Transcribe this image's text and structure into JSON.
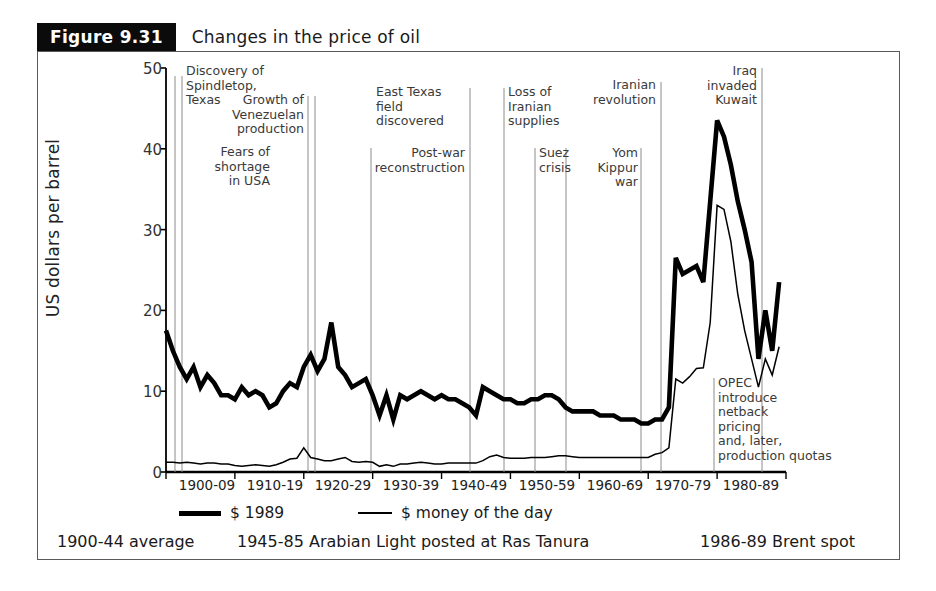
{
  "figure": {
    "badge": "Figure 9.31",
    "title": "Changes in the price of oil"
  },
  "chart_data": {
    "type": "line",
    "title": "Changes in the price of oil",
    "xlabel": "",
    "ylabel": "US dollars per barrel",
    "ylim": [
      0,
      50
    ],
    "yticks": [
      0,
      10,
      20,
      30,
      40,
      50
    ],
    "xtick_labels": [
      "1900-09",
      "1910-19",
      "1920-29",
      "1930-39",
      "1940-49",
      "1950-59",
      "1960-69",
      "1970-79",
      "1980-89"
    ],
    "xlim": [
      1900,
      1990
    ],
    "grid": false,
    "legend_position": "below-axis",
    "series": [
      {
        "name": "$ 1989",
        "style": "thick",
        "x": [
          1900,
          1901,
          1902,
          1903,
          1904,
          1905,
          1906,
          1907,
          1908,
          1909,
          1910,
          1911,
          1912,
          1913,
          1914,
          1915,
          1916,
          1917,
          1918,
          1919,
          1920,
          1921,
          1922,
          1923,
          1924,
          1925,
          1926,
          1927,
          1928,
          1929,
          1930,
          1931,
          1932,
          1933,
          1934,
          1935,
          1936,
          1937,
          1938,
          1939,
          1940,
          1941,
          1942,
          1943,
          1944,
          1945,
          1946,
          1947,
          1948,
          1949,
          1950,
          1951,
          1952,
          1953,
          1954,
          1955,
          1956,
          1957,
          1958,
          1959,
          1960,
          1961,
          1962,
          1963,
          1964,
          1965,
          1966,
          1967,
          1968,
          1969,
          1970,
          1971,
          1972,
          1973,
          1974,
          1975,
          1976,
          1977,
          1978,
          1979,
          1980,
          1981,
          1982,
          1983,
          1984,
          1985,
          1986,
          1987,
          1988,
          1989
        ],
        "values": [
          17.5,
          15.0,
          13.0,
          11.5,
          13.0,
          10.5,
          12.0,
          11.0,
          9.5,
          9.5,
          9.0,
          10.5,
          9.5,
          10.0,
          9.5,
          8.0,
          8.5,
          10.0,
          11.0,
          10.5,
          13.0,
          14.5,
          12.5,
          14.0,
          18.5,
          13.0,
          12.0,
          10.5,
          11.0,
          11.5,
          9.5,
          7.0,
          9.5,
          6.5,
          9.5,
          9.0,
          9.5,
          10.0,
          9.5,
          9.0,
          9.5,
          9.0,
          9.0,
          8.5,
          8.0,
          7.0,
          10.5,
          10.0,
          9.5,
          9.0,
          9.0,
          8.5,
          8.5,
          9.0,
          9.0,
          9.5,
          9.5,
          9.0,
          8.0,
          7.5,
          7.5,
          7.5,
          7.5,
          7.0,
          7.0,
          7.0,
          6.5,
          6.5,
          6.5,
          6.0,
          6.0,
          6.5,
          6.5,
          8.0,
          26.5,
          24.5,
          25.0,
          25.5,
          23.5,
          33.5,
          43.5,
          41.5,
          38.0,
          33.5,
          30.0,
          26.0,
          14.0,
          20.0,
          15.0,
          23.5
        ]
      },
      {
        "name": "$ money of the day",
        "style": "thin",
        "x": [
          1900,
          1901,
          1902,
          1903,
          1904,
          1905,
          1906,
          1907,
          1908,
          1909,
          1910,
          1911,
          1912,
          1913,
          1914,
          1915,
          1916,
          1917,
          1918,
          1919,
          1920,
          1921,
          1922,
          1923,
          1924,
          1925,
          1926,
          1927,
          1928,
          1929,
          1930,
          1931,
          1932,
          1933,
          1934,
          1935,
          1936,
          1937,
          1938,
          1939,
          1940,
          1941,
          1942,
          1943,
          1944,
          1945,
          1946,
          1947,
          1948,
          1949,
          1950,
          1951,
          1952,
          1953,
          1954,
          1955,
          1956,
          1957,
          1958,
          1959,
          1960,
          1961,
          1962,
          1963,
          1964,
          1965,
          1966,
          1967,
          1968,
          1969,
          1970,
          1971,
          1972,
          1973,
          1974,
          1975,
          1976,
          1977,
          1978,
          1979,
          1980,
          1981,
          1982,
          1983,
          1984,
          1985,
          1986,
          1987,
          1988,
          1989
        ],
        "values": [
          1.2,
          1.2,
          1.1,
          1.2,
          1.1,
          1.0,
          1.1,
          1.1,
          1.0,
          1.0,
          0.8,
          0.7,
          0.8,
          0.9,
          0.8,
          0.7,
          0.9,
          1.2,
          1.6,
          1.7,
          3.0,
          1.8,
          1.6,
          1.4,
          1.4,
          1.6,
          1.8,
          1.3,
          1.2,
          1.3,
          1.2,
          0.7,
          0.9,
          0.7,
          1.0,
          1.0,
          1.1,
          1.2,
          1.1,
          1.0,
          1.0,
          1.1,
          1.1,
          1.1,
          1.1,
          1.1,
          1.4,
          1.9,
          2.1,
          1.8,
          1.7,
          1.7,
          1.7,
          1.8,
          1.8,
          1.8,
          1.9,
          2.0,
          2.0,
          1.9,
          1.8,
          1.8,
          1.8,
          1.8,
          1.8,
          1.8,
          1.8,
          1.8,
          1.8,
          1.8,
          1.8,
          2.2,
          2.4,
          3.0,
          11.5,
          11.0,
          11.8,
          12.8,
          12.9,
          18.5,
          33.0,
          32.5,
          28.5,
          22.0,
          17.5,
          14.0,
          10.5,
          14.0,
          12.0,
          15.5
        ]
      }
    ],
    "annotations": [
      {
        "id": "spindletop",
        "text": "Discovery of\nSpindletop,\nTexas",
        "year": 1901,
        "align": "left"
      },
      {
        "id": "venezuela",
        "text": "Growth of\nVenezuelan\nproduction",
        "year": 1922,
        "align": "right"
      },
      {
        "id": "fears-shortage",
        "text": "Fears of\nshortage\nin USA",
        "year": 1920,
        "align": "right"
      },
      {
        "id": "east-texas",
        "text": "East Texas\nfield\ndiscovered",
        "year": 1931,
        "align": "left"
      },
      {
        "id": "post-war",
        "text": "Post-war\nreconstruction",
        "year": 1946,
        "align": "right"
      },
      {
        "id": "loss-iranian",
        "text": "Loss of\nIranian\nsupplies",
        "year": 1951,
        "align": "left"
      },
      {
        "id": "suez",
        "text": "Suez\ncrisis",
        "year": 1956,
        "align": "left"
      },
      {
        "id": "yom-kippur",
        "text": "Yom\nKippur\nwar",
        "year": 1973,
        "align": "right"
      },
      {
        "id": "iranian-revolution",
        "text": "Iranian\nrevolution",
        "year": 1979,
        "align": "right"
      },
      {
        "id": "iraq-kuwait",
        "text": "Iraq\ninvaded\nKuwait",
        "year": 1990,
        "align": "right"
      },
      {
        "id": "opec-netback",
        "text": "OPEC\nintroduce\nnetback\npricing\nand, later,\nproduction quotas",
        "year": 1985,
        "align": "left"
      }
    ]
  },
  "axis": {
    "ylabel": "US dollars per barrel",
    "yticks": [
      "50",
      "40",
      "30",
      "20",
      "10",
      "0"
    ],
    "xticks": [
      "1900-09",
      "1910-19",
      "1920-29",
      "1930-39",
      "1940-49",
      "1950-59",
      "1960-69",
      "1970-79",
      "1980-89"
    ]
  },
  "annotations": {
    "spindletop": [
      "Discovery of",
      "Spindletop,",
      "Texas"
    ],
    "venezuela": [
      "Growth of",
      "Venezuelan",
      "production"
    ],
    "fears": [
      "Fears of",
      "shortage",
      "in USA"
    ],
    "east_texas": [
      "East Texas",
      "field",
      "discovered"
    ],
    "post_war": [
      "Post-war",
      "reconstruction"
    ],
    "loss_iranian": [
      "Loss of",
      "Iranian",
      "supplies"
    ],
    "suez": [
      "Suez",
      "crisis"
    ],
    "yom_kippur": [
      "Yom",
      "Kippur",
      "war"
    ],
    "iranian_revolution": [
      "Iranian",
      "revolution"
    ],
    "iraq_kuwait": [
      "Iraq",
      "invaded",
      "Kuwait"
    ],
    "opec": [
      "OPEC",
      "introduce",
      "netback",
      "pricing",
      "and, later,",
      "production quotas"
    ]
  },
  "legend": {
    "series1": "$ 1989",
    "series2": "$ money of the day"
  },
  "footer": {
    "left": "1900-44 average",
    "middle": "1945-85 Arabian Light posted at Ras Tanura",
    "right": "1986-89 Brent spot"
  }
}
